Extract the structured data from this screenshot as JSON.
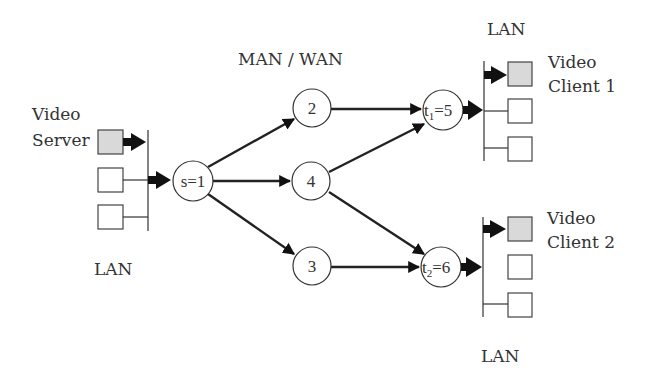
{
  "diagram": {
    "regions": {
      "core": "MAN / WAN",
      "lan_server": "LAN",
      "lan_client1": "LAN",
      "lan_client2": "LAN"
    },
    "endpoints": {
      "server": {
        "line1": "Video",
        "line2": "Server"
      },
      "client1": {
        "line1": "Video",
        "line2": "Client 1"
      },
      "client2": {
        "line1": "Video",
        "line2": "Client 2"
      }
    },
    "nodes": [
      {
        "id": "s",
        "label": "s=1"
      },
      {
        "id": "n2",
        "label": "2"
      },
      {
        "id": "n4",
        "label": "4"
      },
      {
        "id": "n3",
        "label": "3"
      },
      {
        "id": "t1",
        "label_main": "t",
        "label_sub": "1",
        "label_rest": "=5"
      },
      {
        "id": "t2",
        "label_main": "t",
        "label_sub": "2",
        "label_rest": "=6"
      }
    ],
    "edges": [
      {
        "from": "s",
        "to": "n2"
      },
      {
        "from": "s",
        "to": "n4"
      },
      {
        "from": "s",
        "to": "n3"
      },
      {
        "from": "n2",
        "to": "t1"
      },
      {
        "from": "n4",
        "to": "t1"
      },
      {
        "from": "n4",
        "to": "t2"
      },
      {
        "from": "n3",
        "to": "t2"
      }
    ],
    "colors": {
      "shaded_host": "#d9d9d9",
      "line": "#222222"
    }
  }
}
